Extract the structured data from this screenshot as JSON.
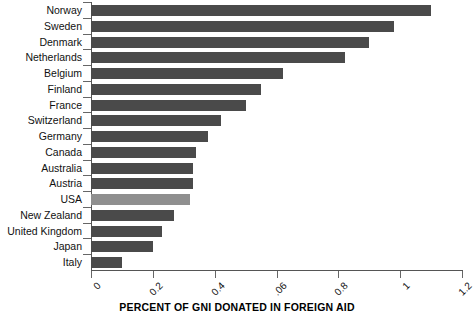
{
  "chart_data": {
    "type": "bar",
    "orientation": "horizontal",
    "title": "",
    "xlabel": "PERCENT OF GNI DONATED IN FOREIGN AID",
    "ylabel": "",
    "xlim": [
      0,
      1.2
    ],
    "grid": false,
    "legend": "none",
    "xticks": [
      0,
      0.2,
      0.4,
      0.6,
      0.8,
      1,
      1.2
    ],
    "xtick_labels": [
      "0",
      "0.2",
      "0.4",
      ".06",
      "0.8",
      "1",
      "1.2"
    ],
    "categories": [
      "Norway",
      "Sweden",
      "Denmark",
      "Netherlands",
      "Belgium",
      "Finland",
      "France",
      "Switzerland",
      "Germany",
      "Canada",
      "Australia",
      "Austria",
      "USA",
      "New Zealand",
      "United Kingdom",
      "Japan",
      "Italy"
    ],
    "values": [
      1.1,
      0.98,
      0.9,
      0.82,
      0.62,
      0.55,
      0.5,
      0.42,
      0.38,
      0.34,
      0.33,
      0.33,
      0.32,
      0.27,
      0.23,
      0.2,
      0.1
    ],
    "highlight_category": "USA",
    "colors": {
      "bar": "#4a4a4a",
      "bar_highlight": "#8f8f8f",
      "axis": "#555555",
      "text": "#111111",
      "background": "#ffffff"
    }
  }
}
